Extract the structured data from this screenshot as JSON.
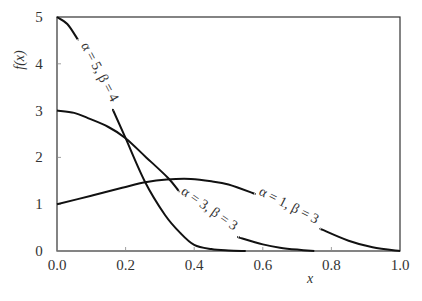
{
  "chart_data": {
    "type": "line",
    "title": "",
    "xlabel": "x",
    "ylabel": "f(x)",
    "xlim": [
      0.0,
      1.0
    ],
    "ylim": [
      0,
      5
    ],
    "xticks": [
      "0.0",
      "0.2",
      "0.4",
      "0.6",
      "0.8",
      "1.0"
    ],
    "yticks": [
      "0",
      "1",
      "2",
      "3",
      "4",
      "5"
    ],
    "grid": false,
    "legend": "inline curve labels",
    "series": [
      {
        "name": "α = 5, β = 4",
        "label_parts": [
          "α = 5, β = 4"
        ],
        "x": [
          0.0,
          0.03,
          0.058,
          0.1,
          0.166,
          0.2,
          0.257,
          0.315,
          0.36,
          0.4,
          0.45,
          0.5,
          0.55
        ],
        "y": [
          5.0,
          4.85,
          4.55,
          3.95,
          2.97,
          2.41,
          1.47,
          0.77,
          0.38,
          0.13,
          0.04,
          0.01,
          0.0
        ]
      },
      {
        "name": "α = 3, β = 3",
        "label_parts": [
          "α = 3, β = 3"
        ],
        "x": [
          0.0,
          0.05,
          0.09,
          0.15,
          0.2,
          0.26,
          0.324,
          0.353,
          0.4,
          0.45,
          0.534,
          0.6,
          0.65,
          0.7,
          0.75
        ],
        "y": [
          3.0,
          2.95,
          2.84,
          2.65,
          2.41,
          2.0,
          1.56,
          1.3,
          0.98,
          0.7,
          0.28,
          0.14,
          0.07,
          0.03,
          0.0
        ]
      },
      {
        "name": "α = 1, β = 3",
        "label_parts": [
          "α = 1, β = 3"
        ],
        "x": [
          0.0,
          0.1,
          0.19,
          0.257,
          0.32,
          0.39,
          0.45,
          0.5,
          0.57,
          0.65,
          0.775,
          0.85,
          0.92,
          1.0
        ],
        "y": [
          1.0,
          1.18,
          1.35,
          1.47,
          1.53,
          1.54,
          1.49,
          1.42,
          1.24,
          1.0,
          0.45,
          0.22,
          0.08,
          0.0
        ]
      }
    ],
    "annotations": [
      {
        "text": "α = 5, β = 4",
        "near_x": 0.12,
        "near_y": 4.0,
        "rotation_deg": 62
      },
      {
        "text": "α = 3, β = 3",
        "near_x": 0.45,
        "near_y": 0.85,
        "rotation_deg": 35
      },
      {
        "text": "α = 1, β = 3",
        "near_x": 0.68,
        "near_y": 0.95,
        "rotation_deg": 28
      }
    ]
  }
}
